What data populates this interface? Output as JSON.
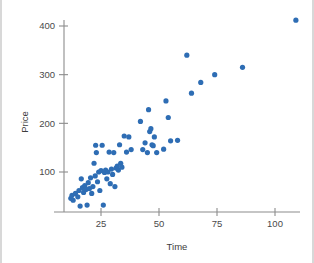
{
  "chart_data": {
    "type": "scatter",
    "title": "",
    "xlabel": "Time",
    "ylabel": "Price",
    "xlim": [
      8,
      115
    ],
    "ylim": [
      20,
      430
    ],
    "grid": false,
    "legend": null,
    "marker_color": "#2E6DB4",
    "axis_color": "#8c8c8c",
    "xticks": [
      25,
      50,
      75,
      100
    ],
    "xtick_labels": [
      "25",
      "50",
      "75",
      "100"
    ],
    "yticks": [
      100,
      200,
      300,
      400
    ],
    "ytick_labels": [
      "100",
      "200",
      "300",
      "400"
    ],
    "points": [
      [
        12,
        46
      ],
      [
        12.5,
        52
      ],
      [
        13,
        42
      ],
      [
        14,
        56
      ],
      [
        15,
        49
      ],
      [
        15.5,
        62
      ],
      [
        16,
        30
      ],
      [
        16.5,
        86
      ],
      [
        17,
        68
      ],
      [
        17.5,
        58
      ],
      [
        18,
        72
      ],
      [
        18.5,
        64
      ],
      [
        19,
        32
      ],
      [
        19.5,
        78
      ],
      [
        20,
        66
      ],
      [
        20.5,
        88
      ],
      [
        21,
        56
      ],
      [
        21.5,
        70
      ],
      [
        22,
        118
      ],
      [
        22.5,
        92
      ],
      [
        22.7,
        155
      ],
      [
        23,
        140
      ],
      [
        23.5,
        80
      ],
      [
        24,
        100
      ],
      [
        24.5,
        62
      ],
      [
        25,
        103
      ],
      [
        25.5,
        155
      ],
      [
        26,
        32
      ],
      [
        26.5,
        99
      ],
      [
        27,
        104
      ],
      [
        27.5,
        86
      ],
      [
        28,
        100
      ],
      [
        28.5,
        141
      ],
      [
        29,
        76
      ],
      [
        29.5,
        106
      ],
      [
        30,
        95
      ],
      [
        30.5,
        140
      ],
      [
        31,
        70
      ],
      [
        31.5,
        108
      ],
      [
        32,
        112
      ],
      [
        32.5,
        104
      ],
      [
        33,
        156
      ],
      [
        33.5,
        118
      ],
      [
        34,
        110
      ],
      [
        35,
        174
      ],
      [
        36,
        141
      ],
      [
        37,
        172
      ],
      [
        38,
        146
      ],
      [
        42,
        204
      ],
      [
        43,
        146
      ],
      [
        44,
        160
      ],
      [
        45,
        140
      ],
      [
        45.5,
        228
      ],
      [
        46,
        183
      ],
      [
        46.5,
        189
      ],
      [
        47,
        156
      ],
      [
        47.5,
        154
      ],
      [
        48,
        172
      ],
      [
        49,
        140
      ],
      [
        52,
        147
      ],
      [
        53,
        246
      ],
      [
        54,
        212
      ],
      [
        55,
        164
      ],
      [
        58,
        165
      ],
      [
        62,
        340
      ],
      [
        64,
        262
      ],
      [
        68,
        284
      ],
      [
        74,
        300
      ],
      [
        86,
        315
      ],
      [
        109,
        412
      ]
    ]
  }
}
